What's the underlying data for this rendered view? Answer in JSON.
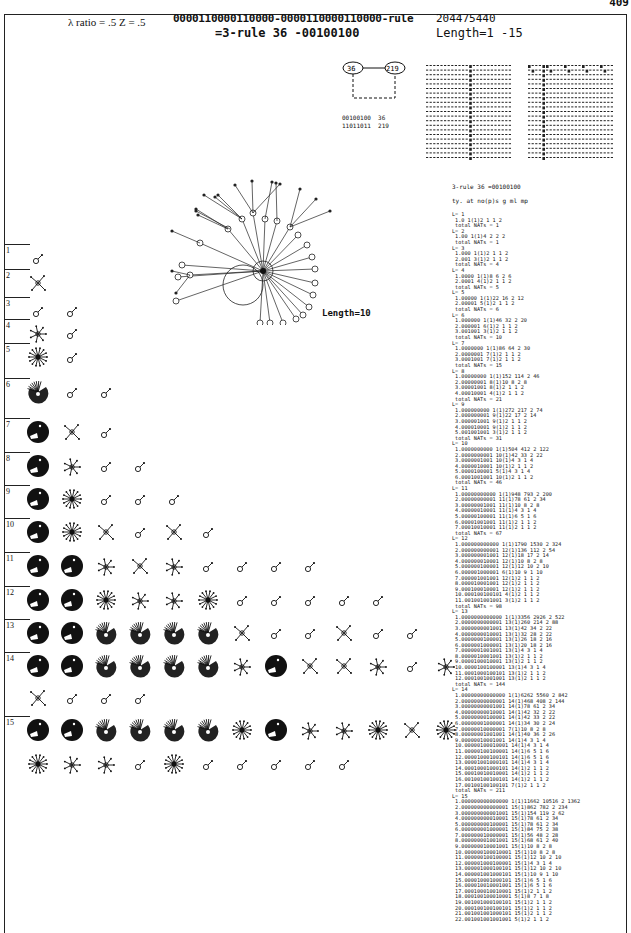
{
  "page": {
    "number": "409",
    "header": {
      "params": "λ ratio = .5   Z = .5",
      "rule_line1": "0000110000110000-0000110000110000-rule",
      "rule_line2": "=3-rule 36 -00100100",
      "rule_number": "204475440",
      "length_range": "Length=1 -15"
    },
    "rule_legend": {
      "nodes": [
        "36",
        "219"
      ],
      "bits": "00100100  36\n11011011  219"
    },
    "main_field_label": "Length=10",
    "row_labels": [
      "1",
      "2",
      "3",
      "4",
      "5",
      "6",
      "7",
      "8",
      "9",
      "10",
      "11",
      "12",
      "13",
      "14",
      "15"
    ],
    "data_column": {
      "title": "3-rule 36 =00100100",
      "columns_header": "ty. at no(p)s g ml mp",
      "text": "L= 1\n 1.0 1(1)2 1 1 2\n total NATs = 1\nL= 2\n 1.00 1(1)4 2 2 2\n total NATs = 1\nL= 3\n 1.000 1(1)2 1 1 2\n 2.001 3(1)2 1 1 2\n total NATs = 4\nL= 4\n 1.0000 1(1)8 6 2 6\n 2.0001 4(1)2 1 1 2\n total NATs = 5\nL= 5\n 1.00000 1(1)22 16 2 12\n 2.00001 5(1)2 1 1 2\n total NATs = 6\nL= 6\n 1.000000 1(1)46 32 2 20\n 2.000001 6(1)2 1 1 2\n 3.001001 3(1)2 1 1 2\n total NATs = 10\nL= 7\n 1.0000000 1(1)86 64 2 30\n 2.0000001 7(1)2 1 1 2\n 3.0001001 7(1)2 1 1 2\n total NATs = 15\nL= 8\n 1.00000000 1(1)152 114 2 46\n 2.00000001 8(1)10 8 2 8\n 3.00001001 8(1)2 1 1 2\n 4.00010001 4(1)2 1 1 2\n total NATs = 21\nL= 9\n 1.000000000 1(1)272 217 2 74\n 2.000000001 9(1)22 17 2 14\n 3.000001001 9(1)2 1 1 2\n 4.000010001 9(1)2 1 1 2\n 5.001001001 3(1)2 1 1 2\n total NATs = 31\nL= 10\n 1.0000000000 1(1)504 412 2 122\n 2.0000000001 10(1)42 33 2 22\n 3.0000001001 10(1)4 3 1 4\n 4.0000010001 10(1)2 1 1 2\n 5.0000100001 5(1)4 3 1 4\n 6.0001001001 10(1)2 1 1 2\n total NATs = 46\nL= 11\n 1.00000000000 1(1)948 793 2 200\n 2.00000000001 11(1)78 61 2 34\n 3.00000001001 11(1)10 8 2 8\n 4.00000010001 11(1)4 3 1 4\n 5.00000100001 11(1)6 5 1 6\n 6.00001001001 11(1)2 1 1 2\n 7.00010010001 11(1)2 1 1 2\n total NATs = 67\nL= 12\n 1.000000000000 1(1)1790 1530 2 324\n 2.000000000001 12(1)136 112 2 54\n 3.000000001001 12(1)18 17 2 14\n 4.000000010001 12(1)10 8 2 8\n 5.000000100001 12(1)12 10 2 10\n 6.000001000001 6(1)10 9 1 10\n 7.000001001001 12(1)2 1 1 2\n 8.000010001001 12(1)2 1 1 2\n 9.000100010001 12(1)2 1 1 2\n 10.000100100101 4(1)2 1 1 2\n 11.001001001001 3(1)2 1 1 2\n total NATs = 98\nL= 13\n 1.0000000000000 1(1)3356 2926 2 522\n 2.0000000000001 13(1)260 214 2 88\n 3.0000000001001 13(1)42 34 2 22\n 4.0000000010001 13(1)32 28 2 22\n 5.0000000100001 13(1)26 18 2 16\n 6.0000001000001 13(1)20 18 2 16\n 7.0000001001001 13(1)4 3 1 4\n 8.0000010001001 13(1)2 1 1 2\n 9.0000100010001 13(1)2 1 1 2\n 10.0000100100001 13(1)4 3 1 4\n 11.0001000100101 13(1)2 1 1 2\n 12.0001001001001 13(1)2 1 1 2\n total NATs = 144\nL= 14\n 1.00000000000000 1(1)6262 5560 2 842\n 2.00000000000001 14(1)468 408 2 144\n 3.00000000001001 14(1)78 61 2 34\n 4.00000000010001 14(1)42 32 2 22\n 5.00000000100001 14(1)42 33 2 22\n 6.00000001000001 14(1)34 30 2 24\n 7.00000010000001 7(1)10 8 2 8\n 8.00000001001001 14(1)40 36 2 26\n 9.00000010001001 14(1)4 3 1 4\n 10.00000100010001 14(1)4 3 1 4\n 11.00000100100001 14(1)6 5 1 6\n 12.00001000100101 14(1)6 5 1 6\n 13.00001001000101 14(1)4 3 1 4\n 14.00010001000101 14(1)2 1 1 2\n 15.00010010010001 14(1)2 1 1 2\n 16.00100100100101 14(1)2 1 1 2\n 17.00100100100101 7(1)2 1 1 2\n total NATs = 211\nL= 15\n 1.000000000000000 1(1)11662 10516 2 1362\n 2.000000000000001 15(1)862 782 2 234\n 3.000000000001001 15(1)154 119 2 62\n 4.000000000010001 15(1)78 61 2 34\n 5.000000000100001 15(1)78 61 2 34\n 6.000000001000001 15(1)84 75 2 38\n 7.000000010000001 15(1)56 48 2 28\n 8.000000001001001 15(1)68 61 2 40\n 9.000000010001001 15(1)10 8 2 8\n 10.000000100010001 15(1)10 8 2 8\n 11.000000100100001 15(1)12 10 2 10\n 12.000001000100001 15(1)4 3 1 4\n 13.000001000100101 15(1)12 10 2 10\n 14.000001001000101 15(1)10 9 1 10\n 15.000010001000101 15(1)6 5 1 6\n 16.000010010001001 15(1)6 5 1 6\n 17.000100010010001 15(1)2 1 1 2\n 18.000100100010001 5(1)8 7 1 8\n 19.001001000100101 15(1)2 1 1 2\n 20.000100100100101 15(1)2 1 1 2\n 21.001001001000101 15(1)2 1 1 2\n 22.001001001001001 5(1)2 1 1 2"
    },
    "glyph_rows": [
      {
        "label": "1",
        "y": 258,
        "glyphs": [
          "s"
        ]
      },
      {
        "label": "2",
        "y": 283,
        "glyphs": [
          "x2"
        ]
      },
      {
        "label": "3",
        "y": 311,
        "glyphs": [
          "s",
          "s"
        ]
      },
      {
        "label": "4",
        "y": 333,
        "glyphs": [
          "st",
          "s"
        ]
      },
      {
        "label": "5",
        "y": 357,
        "glyphs": [
          "burst",
          "s"
        ]
      },
      {
        "label": "6",
        "y": 392,
        "glyphs": [
          "fan",
          "s",
          "s"
        ]
      },
      {
        "label": "7",
        "y": 432,
        "glyphs": [
          "disc",
          "x",
          "s"
        ]
      },
      {
        "label": "8",
        "y": 466,
        "glyphs": [
          "disc",
          "st",
          "s",
          "s"
        ]
      },
      {
        "label": "9",
        "y": 499,
        "glyphs": [
          "disc",
          "burst",
          "s",
          "s",
          "s"
        ]
      },
      {
        "label": "10",
        "y": 532,
        "glyphs": [
          "disc",
          "burst",
          "x",
          "s",
          "x",
          "s"
        ]
      },
      {
        "label": "11",
        "y": 566,
        "glyphs": [
          "disc",
          "disc",
          "st",
          "x",
          "st",
          "s",
          "s",
          "s",
          "s"
        ]
      },
      {
        "label": "12",
        "y": 600,
        "glyphs": [
          "disc",
          "disc",
          "burst",
          "st",
          "st",
          "burst",
          "s",
          "s",
          "s",
          "s",
          "s"
        ]
      },
      {
        "label": "13",
        "y": 633,
        "glyphs": [
          "disc",
          "disc",
          "fan",
          "fan",
          "fan",
          "fan",
          "x",
          "s",
          "s",
          "x",
          "s",
          "s"
        ]
      },
      {
        "label": "14",
        "y": 666,
        "glyphs": [
          "disc",
          "disc",
          "fan",
          "fan",
          "fan",
          "fan",
          "st",
          "disc",
          "x",
          "x",
          "st",
          "s",
          "st"
        ]
      },
      {
        "label": "",
        "y": 698,
        "glyphs": [
          "x",
          "s",
          "s",
          "s"
        ]
      },
      {
        "label": "15",
        "y": 730,
        "glyphs": [
          "disc",
          "disc",
          "fan",
          "fan",
          "fan",
          "fan",
          "burst",
          "disc",
          "st",
          "st",
          "burst",
          "x",
          "burst"
        ]
      },
      {
        "label": "",
        "y": 764,
        "glyphs": [
          "burst",
          "st",
          "st",
          "s",
          "burst",
          "s",
          "s",
          "s",
          "s",
          "s"
        ]
      }
    ]
  }
}
